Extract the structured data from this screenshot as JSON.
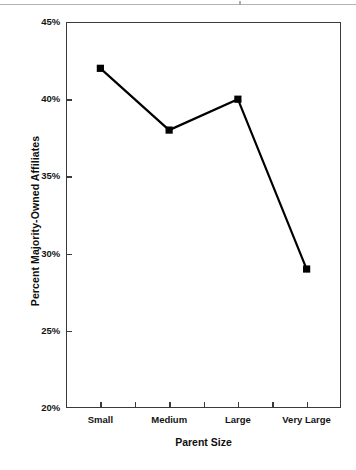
{
  "chart_data": {
    "type": "line",
    "title": "",
    "subtitle": "",
    "xlabel": "Parent Size",
    "ylabel": "Percent Majority-Owned Affiliates",
    "categories": [
      "Small",
      "Medium",
      "Large",
      "Very Large"
    ],
    "values": [
      42,
      38,
      40,
      29
    ],
    "value_labels": [
      "42%",
      "38%",
      "40%",
      "29%"
    ],
    "ylim": [
      20,
      45
    ],
    "ytick_labels": [
      "45%",
      "40%",
      "35%",
      "30%",
      "25%",
      "20%"
    ],
    "ytick_values": [
      45,
      40,
      35,
      30,
      25,
      20
    ],
    "grid": false,
    "legend": false,
    "legend_position": "none",
    "series": [
      {
        "name": "Percent Majority-Owned Affiliates",
        "values": [
          42,
          38,
          40,
          29
        ],
        "marker": "filled-square",
        "marker_color": "#000000",
        "line_color": "#000000"
      }
    ],
    "annotations": [],
    "minor_xticks": true
  },
  "colors": {
    "line": "#000000",
    "marker": "#000000",
    "axis": "#3a3a3a",
    "text": "#111111",
    "background": "#ffffff"
  }
}
